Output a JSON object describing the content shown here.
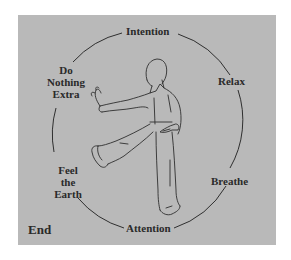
{
  "diagram": {
    "panel_color": "#b9b9b9",
    "line_color": "#2f2f2f",
    "text_color": "#2a2a2a",
    "figure": "tai-chi-practitioner-standing-on-one-leg",
    "cycle_labels": {
      "top": "Intention",
      "right_upper": "Relax",
      "right_lower": "Breathe",
      "bottom": "Attention",
      "left_lower": [
        "Feel",
        "the",
        "Earth"
      ],
      "left_upper": [
        "Do",
        "Nothing",
        "Extra"
      ]
    },
    "end_label": "End"
  }
}
